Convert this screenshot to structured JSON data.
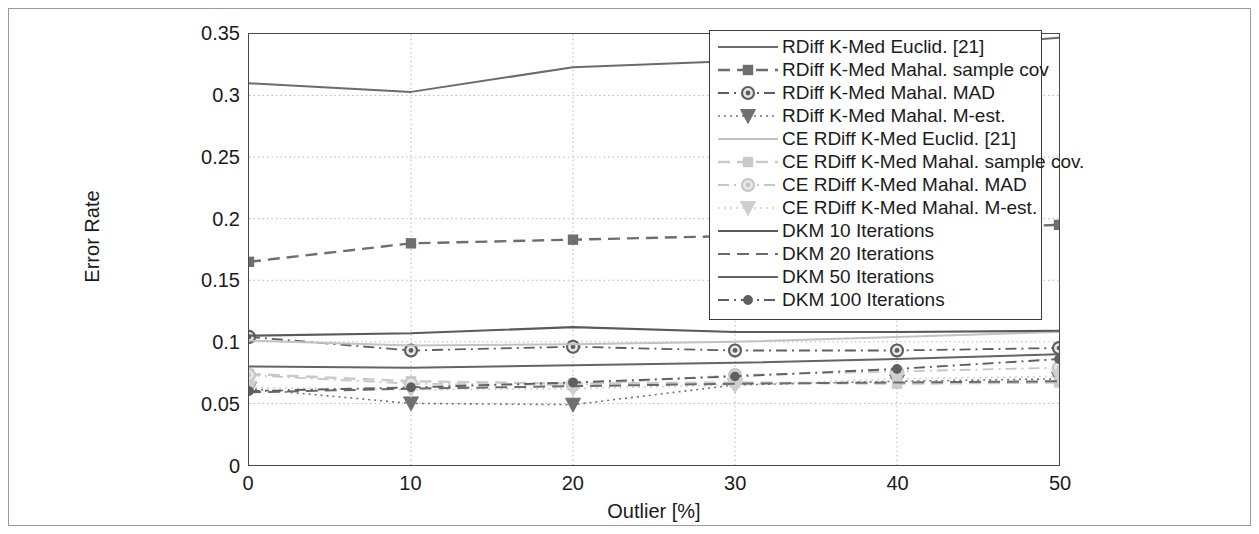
{
  "chart_data": {
    "type": "line",
    "title": "",
    "xlabel": "Outlier [%]",
    "ylabel": "Error Rate",
    "x": [
      0,
      10,
      20,
      30,
      40,
      50
    ],
    "xlim": [
      0,
      50
    ],
    "ylim": [
      0,
      0.35
    ],
    "xticks": [
      "0",
      "10",
      "20",
      "30",
      "40",
      "50"
    ],
    "yticks": [
      "0",
      "0.05",
      "0.1",
      "0.15",
      "0.2",
      "0.25",
      "0.3",
      "0.35"
    ],
    "ytick_values": [
      0,
      0.05,
      0.1,
      0.15,
      0.2,
      0.25,
      0.3,
      0.35
    ],
    "grid": true,
    "grid_style": "dotted",
    "legend_position": "top-right",
    "series": [
      {
        "name": "RDiff K-Med Euclid. [21]",
        "values": [
          0.31,
          0.303,
          0.323,
          0.328,
          0.337,
          0.347
        ],
        "style": "solid",
        "marker": "none",
        "color": "#6b6b6b",
        "width": 2.0
      },
      {
        "name": "RDiff K-Med Mahal. sample cov",
        "values": [
          0.165,
          0.18,
          0.183,
          0.186,
          0.191,
          0.195
        ],
        "style": "dashed",
        "marker": "square",
        "color": "#6e6e6e",
        "width": 2.4
      },
      {
        "name": "RDiff K-Med Mahal. MAD",
        "values": [
          0.104,
          0.093,
          0.096,
          0.093,
          0.093,
          0.095
        ],
        "style": "dashdot",
        "marker": "circle",
        "color": "#5e5e5e",
        "width": 1.8
      },
      {
        "name": "RDiff K-Med Mahal. M-est.",
        "values": [
          0.062,
          0.05,
          0.049,
          0.065,
          0.068,
          0.07
        ],
        "style": "dotted",
        "marker": "triangle-down",
        "color": "#707070",
        "width": 1.6
      },
      {
        "name": "CE RDiff K-Med Euclid. [21]",
        "values": [
          0.101,
          0.097,
          0.098,
          0.1,
          0.104,
          0.108
        ],
        "style": "solid",
        "marker": "none",
        "color": "#c2c2c2",
        "width": 2.0
      },
      {
        "name": "CE RDiff K-Med Mahal. sample cov.",
        "values": [
          0.074,
          0.068,
          0.066,
          0.067,
          0.066,
          0.067
        ],
        "style": "dashed",
        "marker": "square",
        "color": "#cacaca",
        "width": 2.4
      },
      {
        "name": "CE RDiff K-Med Mahal. MAD",
        "values": [
          0.073,
          0.066,
          0.065,
          0.073,
          0.076,
          0.079
        ],
        "style": "dashdot",
        "marker": "circle",
        "color": "#c6c6c6",
        "width": 1.8
      },
      {
        "name": "CE RDiff K-Med Mahal. M-est.",
        "values": [
          0.063,
          0.061,
          0.062,
          0.065,
          0.07,
          0.072
        ],
        "style": "dotted",
        "marker": "triangle-down",
        "color": "#cfcfcf",
        "width": 1.6
      },
      {
        "name": "DKM 10 Iterations",
        "values": [
          0.105,
          0.107,
          0.112,
          0.108,
          0.108,
          0.109
        ],
        "style": "solid",
        "marker": "none",
        "color": "#5a5a5a",
        "width": 2.2
      },
      {
        "name": "DKM 20 Iterations",
        "values": [
          0.059,
          0.062,
          0.064,
          0.066,
          0.067,
          0.068
        ],
        "style": "dashed",
        "marker": "none",
        "color": "#6a6a6a",
        "width": 2.0
      },
      {
        "name": "DKM 50 Iterations",
        "values": [
          0.08,
          0.079,
          0.081,
          0.083,
          0.086,
          0.09
        ],
        "style": "solid",
        "marker": "none",
        "color": "#646464",
        "width": 2.0
      },
      {
        "name": "DKM 100 Iterations",
        "values": [
          0.06,
          0.063,
          0.067,
          0.072,
          0.078,
          0.086
        ],
        "style": "dashdot",
        "marker": "circle-small",
        "color": "#5f5f5f",
        "width": 1.9
      }
    ]
  },
  "legend": {
    "entries": [
      "RDiff K-Med Euclid. [21]",
      "RDiff K-Med Mahal. sample cov",
      "RDiff K-Med Mahal. MAD",
      "RDiff K-Med Mahal. M-est.",
      "CE RDiff K-Med Euclid. [21]",
      "CE RDiff K-Med Mahal. sample cov.",
      "CE RDiff K-Med Mahal. MAD",
      "CE RDiff K-Med Mahal. M-est.",
      "DKM 10 Iterations",
      "DKM 20 Iterations",
      "DKM 50 Iterations",
      "DKM 100 Iterations"
    ]
  },
  "colors": {
    "axis": "#4a4a4a",
    "grid": "#b5b5b5",
    "frame": "#9a9a9a",
    "text": "#1b1b1b",
    "background": "#ffffff"
  }
}
